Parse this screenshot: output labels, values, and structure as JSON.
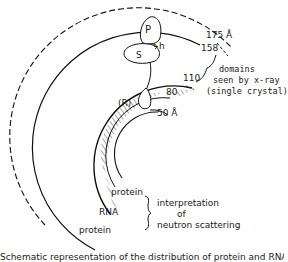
{
  "figure": {
    "radii_labels": {
      "outer_dashed": "175 Å",
      "outer_solid": "158",
      "hatch_outer": "110",
      "hatch_inner": "80",
      "inner": "50 Å"
    },
    "domains": {
      "P": "P",
      "S": "S",
      "h": "h",
      "R": "(R)"
    },
    "xray_note": {
      "line1": "domains",
      "line2": "seen by x-ray",
      "line3": "(single crystal)"
    },
    "layers": {
      "inner_protein": "protein",
      "rna": "RNA",
      "outer_protein": "protein"
    },
    "neutron_note": {
      "line1": "interpretation",
      "line2": "of",
      "line3": "neutron scattering"
    },
    "caption": "Schematic representation of the distribution of protein and RNA"
  }
}
